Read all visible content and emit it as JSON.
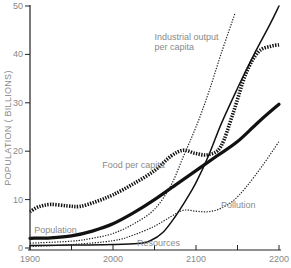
{
  "chart_data": {
    "type": "line",
    "title": "",
    "xlabel": "",
    "ylabel": "POPULATION ( BILLIONS)",
    "xlim": [
      1900,
      2200
    ],
    "ylim": [
      0,
      50
    ],
    "x_ticks": [
      1900,
      1950,
      2000,
      2050,
      2100,
      2150,
      2200
    ],
    "x_tick_labels": [
      "1900",
      "2000",
      "2100",
      "2200"
    ],
    "y_ticks": [
      0,
      10,
      20,
      30,
      40,
      50
    ],
    "y_tick_labels": [
      "0",
      "10",
      "20",
      "30",
      "40",
      "50"
    ],
    "grid": false,
    "legend": "inline labels",
    "series": [
      {
        "name": "Population",
        "style": "thick-solid",
        "label_pos": [
          1905,
          3.2
        ],
        "points": [
          [
            1900,
            2
          ],
          [
            1925,
            2.1
          ],
          [
            1950,
            2.5
          ],
          [
            1975,
            3.5
          ],
          [
            2000,
            5
          ],
          [
            2025,
            7.3
          ],
          [
            2050,
            10
          ],
          [
            2075,
            13
          ],
          [
            2100,
            16
          ],
          [
            2125,
            19
          ],
          [
            2150,
            22
          ],
          [
            2175,
            26
          ],
          [
            2200,
            29.7
          ]
        ]
      },
      {
        "name": "Food per capita",
        "style": "thick-dotted",
        "label_pos": [
          1987,
          16.5
        ],
        "points": [
          [
            1900,
            7.5
          ],
          [
            1910,
            8.5
          ],
          [
            1925,
            9
          ],
          [
            1945,
            8.7
          ],
          [
            1960,
            8.6
          ],
          [
            1980,
            9.6
          ],
          [
            2000,
            11
          ],
          [
            2025,
            13.3
          ],
          [
            2050,
            16
          ],
          [
            2070,
            19
          ],
          [
            2085,
            20.2
          ],
          [
            2100,
            19.5
          ],
          [
            2115,
            19.3
          ],
          [
            2130,
            21
          ],
          [
            2145,
            28
          ],
          [
            2160,
            36
          ],
          [
            2175,
            40.5
          ],
          [
            2190,
            41.7
          ],
          [
            2200,
            42
          ]
        ]
      },
      {
        "name": "Industrial output per capita",
        "style": "thin-dotted",
        "label_pos": [
          2050,
          43
        ],
        "points": [
          [
            1900,
            1
          ],
          [
            1950,
            1.4
          ],
          [
            1975,
            2
          ],
          [
            2000,
            3
          ],
          [
            2025,
            5
          ],
          [
            2050,
            8
          ],
          [
            2070,
            13
          ],
          [
            2085,
            19
          ],
          [
            2100,
            25
          ],
          [
            2115,
            32
          ],
          [
            2130,
            40
          ],
          [
            2147,
            48.5
          ]
        ]
      },
      {
        "name": "Resources",
        "style": "thin-solid",
        "label_pos": [
          2029,
          0.4
        ],
        "points": [
          [
            1900,
            0.5
          ],
          [
            1950,
            0.6
          ],
          [
            2000,
            0.7
          ],
          [
            2030,
            0.9
          ],
          [
            2045,
            1.5
          ],
          [
            2060,
            3.2
          ],
          [
            2075,
            6.5
          ],
          [
            2090,
            10.5
          ],
          [
            2100,
            13.5
          ],
          [
            2115,
            19
          ],
          [
            2130,
            25.5
          ],
          [
            2150,
            33
          ],
          [
            2170,
            40
          ],
          [
            2190,
            46.5
          ],
          [
            2200,
            50
          ]
        ]
      },
      {
        "name": "Pollution",
        "style": "thin-dotted",
        "label_pos": [
          2130,
          8.2
        ],
        "points": [
          [
            1900,
            0.3
          ],
          [
            1950,
            0.7
          ],
          [
            2000,
            1.5
          ],
          [
            2025,
            2.7
          ],
          [
            2050,
            4.5
          ],
          [
            2070,
            6.5
          ],
          [
            2085,
            7.8
          ],
          [
            2100,
            7.6
          ],
          [
            2115,
            7.5
          ],
          [
            2130,
            8.2
          ],
          [
            2145,
            9.8
          ],
          [
            2160,
            12.5
          ],
          [
            2180,
            17
          ],
          [
            2200,
            22
          ]
        ]
      }
    ]
  }
}
